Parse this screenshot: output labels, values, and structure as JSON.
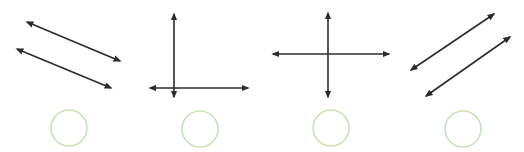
{
  "figure": {
    "width": 524,
    "height": 152,
    "line_color": "#2b2b2b",
    "choice_circle_color": "#c9e2b6",
    "panels": [
      {
        "id": "parallel-descending",
        "description": "two parallel lines sloping downward",
        "lines": [
          {
            "x1": 27,
            "y1": 22,
            "x2": 120,
            "y2": 61
          },
          {
            "x1": 17,
            "y1": 49,
            "x2": 111,
            "y2": 88
          }
        ],
        "choice": {
          "cx": 69,
          "cy": 128,
          "r": 18
        }
      },
      {
        "id": "perpendicular-corner",
        "description": "perpendicular lines meeting near an end",
        "lines": [
          {
            "x1": 174,
            "y1": 14,
            "x2": 174,
            "y2": 97
          },
          {
            "x1": 150,
            "y1": 88,
            "x2": 248,
            "y2": 88
          }
        ],
        "choice": {
          "cx": 200,
          "cy": 129,
          "r": 18
        }
      },
      {
        "id": "perpendicular-cross",
        "description": "perpendicular lines crossing",
        "lines": [
          {
            "x1": 328,
            "y1": 13,
            "x2": 328,
            "y2": 97
          },
          {
            "x1": 273,
            "y1": 54,
            "x2": 389,
            "y2": 54
          }
        ],
        "choice": {
          "cx": 331,
          "cy": 128,
          "r": 18
        }
      },
      {
        "id": "parallel-ascending",
        "description": "two parallel lines sloping upward",
        "lines": [
          {
            "x1": 411,
            "y1": 70,
            "x2": 494,
            "y2": 14
          },
          {
            "x1": 426,
            "y1": 96,
            "x2": 510,
            "y2": 37
          }
        ],
        "choice": {
          "cx": 463,
          "cy": 129,
          "r": 18
        }
      }
    ]
  }
}
